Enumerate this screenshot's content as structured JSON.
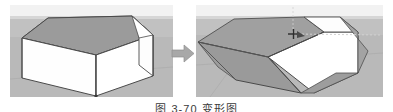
{
  "figure": {
    "caption": "图 3-70  变形图",
    "arrow_icon": "right-arrow-icon",
    "panels": [
      {
        "id": "before",
        "label": "original-model",
        "cursor_visible": false,
        "scene": {
          "sky_color": "#f2f2f2",
          "horizon_color": "#d8d8d8",
          "ground_color": "#b9b9b9",
          "roof_color": "#9a9a9a",
          "roof_shadow_color": "#8e8e8e",
          "wall_light_color": "#ffffff",
          "wall_mid_color": "#f6f6f6",
          "edge_color": "#4a4a4a",
          "gable_color": "#fdfdfd"
        }
      },
      {
        "id": "after",
        "label": "deformed-model",
        "cursor_visible": true,
        "cursor_icon": "move-crosshair-cursor",
        "inference_line_color": "#cfcfcf",
        "scene": {
          "sky_color": "#f2f2f2",
          "horizon_color": "#d8d8d8",
          "ground_color": "#b9b9b9",
          "roof_color": "#9a9a9a",
          "roof_shadow_color": "#8e8e8e",
          "wall_light_color": "#ffffff",
          "wall_mid_color": "#f2f2f2",
          "edge_color": "#4a4a4a",
          "gable_color": "#fdfdfd"
        }
      }
    ]
  },
  "colors": {
    "arrow_fill": "#a8a8a8",
    "arrow_edge": "#8d8d8d",
    "page_background": "#ffffff",
    "caption_text": "#3a3a3a"
  }
}
